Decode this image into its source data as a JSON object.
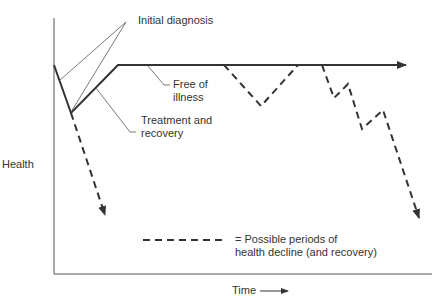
{
  "labels": {
    "initial_diagnosis": "Initial diagnosis",
    "free_of_illness_1": "Free of",
    "free_of_illness_2": "illness",
    "treatment_1": "Treatment and",
    "treatment_2": "recovery",
    "y_axis": "Health",
    "x_axis": "Time",
    "legend_1": "= Possible periods of",
    "legend_2": "health decline (and recovery)"
  },
  "colors": {
    "line": "#333333",
    "text": "#333333",
    "background": "#ffffff"
  }
}
